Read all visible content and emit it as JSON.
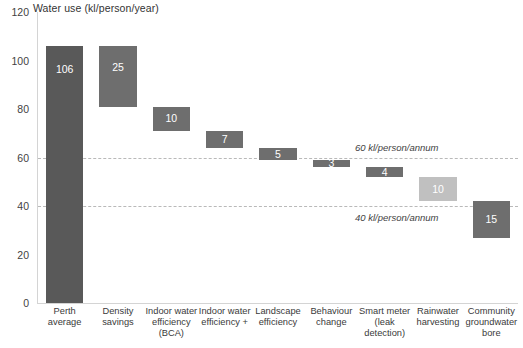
{
  "chart_data": {
    "type": "bar",
    "chart_style": "waterfall",
    "title": "Water use (kl/person/year)",
    "xlabel": "",
    "ylabel": "",
    "ylim": [
      0,
      120
    ],
    "ytick_step": 20,
    "yticks": [
      "120",
      "100",
      "80",
      "60",
      "40",
      "20",
      "0"
    ],
    "grid": false,
    "legend": "none",
    "categories": [
      "Perth average",
      "Density savings",
      "Indoor water efficiency (BCA)",
      "Indoor water efficiency +",
      "Landscape efficiency",
      "Behaviour change",
      "Smart meter (leak detection)",
      "Rainwater harvesting",
      "Community groundwater bore"
    ],
    "category_label_lines": [
      [
        "Perth average"
      ],
      [
        "Density",
        "savings"
      ],
      [
        "Indoor water",
        "efficiency",
        "(BCA)"
      ],
      [
        "Indoor water",
        "efficiency +"
      ],
      [
        "Landscape",
        "efficiency"
      ],
      [
        "Behaviour",
        "change"
      ],
      [
        "Smart meter",
        "(leak",
        "detection)"
      ],
      [
        "Rainwater",
        "harvesting"
      ],
      [
        "Community",
        "groundwater",
        "bore"
      ]
    ],
    "values": [
      106,
      25,
      10,
      7,
      5,
      3,
      4,
      10,
      15
    ],
    "value_labels": [
      "106",
      "25",
      "10",
      "7",
      "5",
      "3",
      "4",
      "10",
      "15"
    ],
    "bar_bases": [
      0,
      81,
      71,
      64,
      59,
      56,
      52,
      42,
      27
    ],
    "bar_tops": [
      106,
      106,
      81,
      71,
      64,
      59,
      56,
      52,
      42
    ],
    "bar_colors": [
      "#595959",
      "#6e6e6e",
      "#6e6e6e",
      "#6e6e6e",
      "#6e6e6e",
      "#6e6e6e",
      "#6e6e6e",
      "#c0c0c0",
      "#6e6e6e"
    ],
    "annotations": [
      {
        "text": "60 kl/person/annum",
        "value": 60
      },
      {
        "text": "40 kl/person/annum",
        "value": 40
      }
    ],
    "reference_lines": [
      60,
      40
    ],
    "reference_line_color": "#b9b9b9",
    "axis_color": "#d4d4d4",
    "background": "#ffffff"
  }
}
